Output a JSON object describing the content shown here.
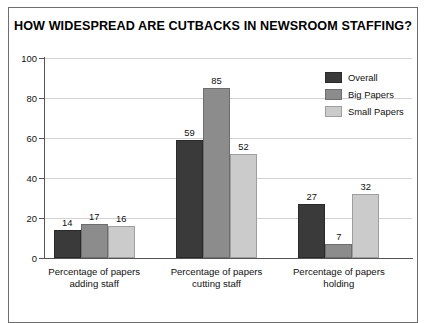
{
  "chart_data": {
    "type": "bar",
    "title": "HOW WIDESPREAD ARE CUTBACKS IN NEWSROOM STAFFING?",
    "xlabel": "",
    "ylabel": "",
    "ylim": [
      0,
      100
    ],
    "yticks": [
      0,
      20,
      40,
      60,
      80,
      100
    ],
    "ytick_labels": [
      "0",
      "20",
      "40",
      "60",
      "80",
      "100"
    ],
    "grid": true,
    "legend_position": "top-right",
    "categories": [
      "Percentage of papers\nadding staff",
      "Percentage of papers\ncutting staff",
      "Percentage of papers\nholding"
    ],
    "category_lines": [
      [
        "Percentage of papers",
        "adding staff"
      ],
      [
        "Percentage of papers",
        "cutting staff"
      ],
      [
        "Percentage of papers",
        "holding"
      ]
    ],
    "series": [
      {
        "name": "Overall",
        "color": "#3a3a3a",
        "values": [
          14,
          59,
          27
        ]
      },
      {
        "name": "Big Papers",
        "color": "#8c8c8c",
        "values": [
          17,
          85,
          7
        ]
      },
      {
        "name": "Small Papers",
        "color": "#cbcbcb",
        "values": [
          16,
          52,
          32
        ]
      }
    ],
    "data_labels": [
      [
        "14",
        "17",
        "16"
      ],
      [
        "59",
        "85",
        "52"
      ],
      [
        "27",
        "7",
        "32"
      ]
    ]
  },
  "colors": {
    "frame_border": "#6e6e6e",
    "axis": "#555555",
    "gridline": "#d2d2d2",
    "background": "#ffffff",
    "text": "#111111"
  }
}
